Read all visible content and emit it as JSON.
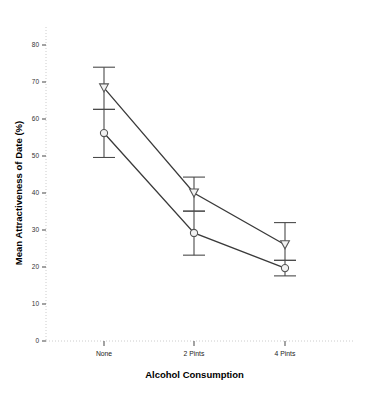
{
  "chart_data": {
    "type": "line",
    "title": "",
    "subtitle": "",
    "xlabel": "Alcohol Consumption",
    "ylabel": "Mean Attractiveness of Date (%)",
    "categories": [
      "None",
      "2 Pints",
      "4 Pints"
    ],
    "ylim": [
      0,
      80
    ],
    "yticks": [
      0,
      10,
      20,
      30,
      40,
      50,
      60,
      70,
      80
    ],
    "ytick_labels": [
      "0",
      "10",
      "20",
      "30",
      "40",
      "50",
      "60",
      "70",
      "80"
    ],
    "grid": false,
    "legend": "none",
    "error_bar_type": "95% CI",
    "series": [
      {
        "name": "series-triangle",
        "marker": "triangle-down",
        "values": [
          68.4,
          40.0,
          26.0
        ],
        "error_upper": [
          74.0,
          44.3,
          32.0
        ],
        "error_lower": [
          62.6,
          35.1,
          21.8
        ]
      },
      {
        "name": "series-circle",
        "marker": "circle",
        "values": [
          56.2,
          29.2,
          19.7
        ],
        "error_upper": [
          62.6,
          35.1,
          21.8
        ],
        "error_lower": [
          49.6,
          23.2,
          17.6
        ]
      }
    ]
  },
  "axis": {
    "x_title": "Alcohol Consumption",
    "y_title": "Mean Attractiveness of Date (%)",
    "y_ticks": [
      "80",
      "70",
      "60",
      "50",
      "40",
      "30",
      "20",
      "10",
      "0"
    ],
    "x_ticks": [
      "None",
      "2 Pints",
      "4 Pints"
    ]
  },
  "style": {
    "line_color": "#3a3a3a",
    "marker_stroke": "#555555",
    "marker_fill": "#f2f2f2",
    "error_color": "#4a4a4a",
    "axis_color": "#cccccc",
    "tick_color": "#666666",
    "background": "#ffffff"
  }
}
